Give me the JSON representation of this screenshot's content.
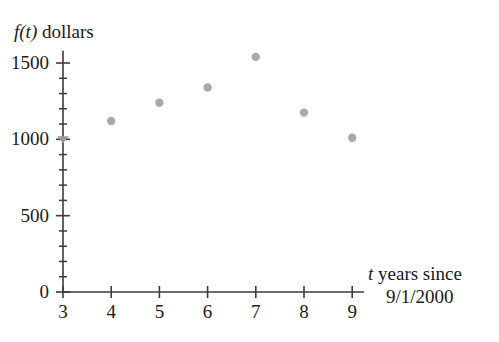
{
  "chart_data": {
    "type": "scatter",
    "title": "",
    "subtitle": "",
    "xlabel_parts": {
      "variable": "t",
      "rest": " years since",
      "line2": "9/1/2000"
    },
    "xlabel": "t years since 9/1/2000",
    "ylabel_parts": {
      "variable": "f(t)",
      "rest": " dollars"
    },
    "ylabel": "f(t) dollars",
    "x": [
      4,
      5,
      6,
      7,
      8,
      9
    ],
    "values": [
      1120,
      1240,
      1340,
      1540,
      1175,
      1010
    ],
    "points": [
      {
        "x": 4,
        "y": 1120
      },
      {
        "x": 5,
        "y": 1240
      },
      {
        "x": 6,
        "y": 1340
      },
      {
        "x": 7,
        "y": 1540
      },
      {
        "x": 8,
        "y": 1175
      },
      {
        "x": 9,
        "y": 1010
      }
    ],
    "xlim": [
      3,
      9
    ],
    "ylim": [
      0,
      1580
    ],
    "xticks": [
      3,
      4,
      5,
      6,
      7,
      8,
      9
    ],
    "xtick_labels": [
      "3",
      "4",
      "5",
      "6",
      "7",
      "8",
      "9"
    ],
    "yticks": [
      0,
      500,
      1000,
      1500
    ],
    "ytick_labels": [
      "0",
      "500",
      "1000",
      "1500"
    ],
    "y_minor_step": 100,
    "grid": false,
    "legend": "none",
    "marker_color": "#a9a9a9",
    "axis_color": "#3c3c3c",
    "text_color": "#1a1a1a"
  }
}
